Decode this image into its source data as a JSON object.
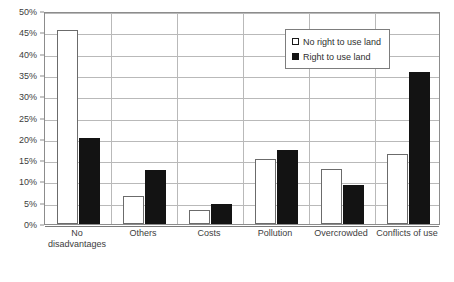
{
  "chart_data": {
    "type": "bar",
    "title": "",
    "subtitle": "",
    "xlabel": "",
    "ylabel": "",
    "categories": [
      "No disadvantages",
      "Others",
      "Costs",
      "Pollution",
      "Overcrowded",
      "Conflicts of use"
    ],
    "series": [
      {
        "name": "No right to use land",
        "color": "#ffffff",
        "border_color": "#6b6b6b",
        "values": [
          45.5,
          6.5,
          3.3,
          15.2,
          13.0,
          16.4
        ]
      },
      {
        "name": "Right to use land",
        "color": "#131313",
        "border_color": "#131313",
        "values": [
          20.3,
          12.7,
          4.8,
          17.3,
          9.1,
          35.6
        ]
      }
    ],
    "ylim": [
      0,
      50
    ],
    "ytick_values": [
      0,
      5,
      10,
      15,
      20,
      25,
      30,
      35,
      40,
      45,
      50
    ],
    "ytick_labels": [
      "0%",
      "5%",
      "10%",
      "15%",
      "20%",
      "25%",
      "30%",
      "35%",
      "40%",
      "45%",
      "50%"
    ],
    "grid": {
      "horizontal": true,
      "vertical": true,
      "color": "#b9b9b9"
    },
    "legend": {
      "position": "top-right-inside",
      "entries": [
        {
          "label": "No right to use land",
          "marker": "open-square"
        },
        {
          "label": "Right to use land",
          "marker": "filled-square"
        }
      ]
    },
    "axis": {
      "frame_color": "#8c8c8c",
      "baseline_color": "#7a7a7a"
    }
  }
}
